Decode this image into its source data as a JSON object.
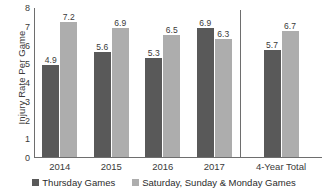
{
  "chart_data": {
    "type": "bar",
    "title": "",
    "subtitle": "",
    "xlabel": "",
    "ylabel": "Injury Rate Per Game",
    "ylim": [
      0,
      8
    ],
    "yticks": [
      0,
      1,
      2,
      3,
      4,
      5,
      6,
      7,
      8
    ],
    "grid": false,
    "legend_position": "bottom",
    "categories": [
      "2014",
      "2015",
      "2016",
      "2017",
      "4-Year Total"
    ],
    "divider_after_category_index": 3,
    "series": [
      {
        "name": "Thursday Games",
        "color": "#595959",
        "values": [
          4.9,
          5.6,
          5.3,
          6.9,
          5.7
        ],
        "labels": [
          "4.9",
          "5.6",
          "5.3",
          "6.9",
          "5.7"
        ]
      },
      {
        "name": "Saturday, Sunday & Monday Games",
        "color": "#adadad",
        "values": [
          7.2,
          6.9,
          6.5,
          6.3,
          6.7
        ],
        "labels": [
          "7.2",
          "6.9",
          "6.5",
          "6.3",
          "6.7"
        ]
      }
    ]
  },
  "axis": {
    "y_tick_labels": [
      "8",
      "7",
      "6",
      "5",
      "4",
      "3",
      "2",
      "1",
      "0"
    ],
    "y_title": "Injury Rate Per Game"
  },
  "legend": {
    "items": [
      {
        "label": "Thursday Games",
        "swatch": "dark-square-icon"
      },
      {
        "label": "Saturday, Sunday & Monday Games",
        "swatch": "light-square-icon"
      }
    ]
  }
}
